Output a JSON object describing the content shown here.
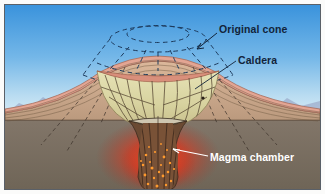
{
  "figure": {
    "border_color": "#5a6068",
    "background": "#fbfbfa"
  },
  "sky": {
    "top_color": "#3f97dd",
    "horizon_color": "#d9ecf6",
    "mountain_color": "#9fa8c6"
  },
  "ground": {
    "bedrock_color": "#7d7265",
    "flank_color": "#c9a98d",
    "flank_top_color": "#e0a492",
    "strata_line_color": "#5d4a3a"
  },
  "caldera": {
    "fill_top_color": "#dfdcae",
    "fill_bottom_color": "#cfc894",
    "rim_color": "#d98f7c",
    "fracture_color": "#4a3a28"
  },
  "magma": {
    "glow_color": "#e03c26",
    "conduit_color": "#6b4a33",
    "speckle_color": "#ff9a2e"
  },
  "original_cone": {
    "line_color": "#1d3a5c",
    "style": "dashed"
  },
  "labels": {
    "original_cone": "Original cone",
    "caldera": "Caldera",
    "magma_chamber": "Magma chamber"
  },
  "icons": {
    "original_cone_leader": "arrow-icon",
    "caldera_leader": "leader-line-icon",
    "magma_chamber_leader": "arrow-icon"
  }
}
